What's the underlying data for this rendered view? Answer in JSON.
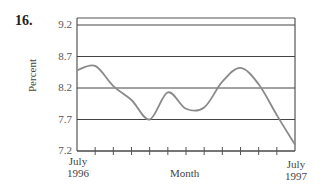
{
  "problem_number": "16.",
  "chart_data": {
    "type": "line",
    "title": "",
    "xlabel": "Month",
    "ylabel": "Percent",
    "ylim": [
      7.2,
      9.2
    ],
    "yticks": [
      "9.2",
      "8.7",
      "8.2",
      "7.7",
      "7.2"
    ],
    "x_start_label": [
      "July",
      "1996"
    ],
    "x_end_label": [
      "July",
      "1997"
    ],
    "categories": [
      "Jul 1996",
      "Aug 1996",
      "Sep 1996",
      "Oct 1996",
      "Nov 1996",
      "Dec 1996",
      "Jan 1997",
      "Feb 1997",
      "Mar 1997",
      "Apr 1997",
      "May 1997",
      "Jun 1997",
      "Jul 1997"
    ],
    "values": [
      8.48,
      8.55,
      8.23,
      8.01,
      7.7,
      8.13,
      7.87,
      7.89,
      8.3,
      8.52,
      8.26,
      7.77,
      7.3
    ],
    "grid": true,
    "legend": null
  },
  "colors": {
    "line": "#8a8a8a",
    "axis": "#555555",
    "grid": "#444444"
  }
}
